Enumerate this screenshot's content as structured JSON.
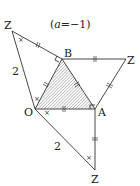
{
  "title": "(a=−1)",
  "title_parts": {
    "open": "(",
    "var": "a",
    "rest": "=−1)"
  },
  "points": {
    "z_top_left": "Z",
    "b": "B",
    "z_right": "Z",
    "o": "O",
    "a": "A",
    "z_bottom": "Z"
  },
  "lengths": {
    "left_side": "2",
    "lower_side": "2"
  },
  "angle_mark": "×",
  "colors": {
    "line": "#333333",
    "hatch": "#555555"
  }
}
